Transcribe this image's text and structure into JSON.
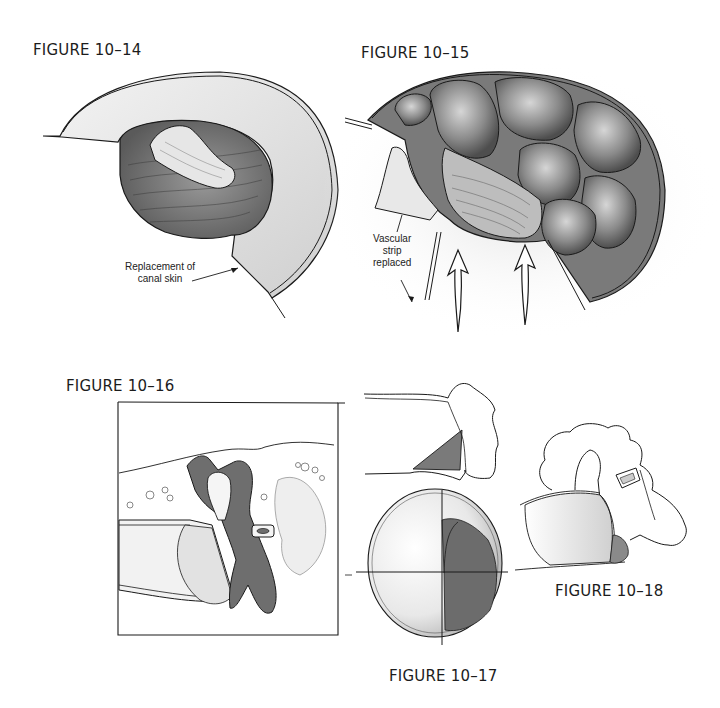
{
  "figures": [
    {
      "id": "10-14",
      "label": "FIGURE 10–14",
      "annotations": [
        {
          "line1": "Replacement of",
          "line2": "canal skin"
        }
      ]
    },
    {
      "id": "10-15",
      "label": "FIGURE 10–15",
      "annotations": [
        {
          "line1": "Vascular",
          "line2": "strip",
          "line3": "replaced"
        }
      ]
    },
    {
      "id": "10-16",
      "label": "FIGURE 10–16"
    },
    {
      "id": "10-17",
      "label": "FIGURE 10–17"
    },
    {
      "id": "10-18",
      "label": "FIGURE 10–18"
    }
  ],
  "colors": {
    "ink": "#1a1a1a",
    "shade_dark": "#5a5a5a",
    "shade_mid": "#8c8c8c",
    "shade_light": "#cfcfcf",
    "paper": "#ffffff"
  }
}
